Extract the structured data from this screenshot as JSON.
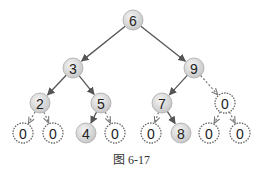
{
  "caption": "图 6-17",
  "colors": {
    "node_fill": "#d9d9d9",
    "node_stroke": "#aaaaaa",
    "edge": "#555555",
    "dashed_edge": "#777777",
    "null_fill": "#ffffff"
  },
  "nodes": [
    {
      "id": "n6",
      "label": "6",
      "x": 133,
      "y": 20,
      "null": false
    },
    {
      "id": "n3",
      "label": "3",
      "x": 73,
      "y": 68,
      "null": false
    },
    {
      "id": "n9",
      "label": "9",
      "x": 194,
      "y": 68,
      "null": false
    },
    {
      "id": "n2",
      "label": "2",
      "x": 40,
      "y": 103,
      "null": false
    },
    {
      "id": "n5",
      "label": "5",
      "x": 101,
      "y": 103,
      "null": false
    },
    {
      "id": "n7",
      "label": "7",
      "x": 162,
      "y": 103,
      "null": false
    },
    {
      "id": "n9r",
      "label": "0",
      "x": 225,
      "y": 103,
      "null": true
    },
    {
      "id": "n2l",
      "label": "0",
      "x": 23,
      "y": 133,
      "null": true
    },
    {
      "id": "n2r",
      "label": "0",
      "x": 53,
      "y": 133,
      "null": true
    },
    {
      "id": "n4",
      "label": "4",
      "x": 86,
      "y": 133,
      "null": false
    },
    {
      "id": "n5r",
      "label": "0",
      "x": 115,
      "y": 133,
      "null": true
    },
    {
      "id": "n7l",
      "label": "0",
      "x": 151,
      "y": 133,
      "null": true
    },
    {
      "id": "n8",
      "label": "8",
      "x": 181,
      "y": 133,
      "null": false
    },
    {
      "id": "n0l",
      "label": "0",
      "x": 209,
      "y": 133,
      "null": true
    },
    {
      "id": "n0r",
      "label": "0",
      "x": 240,
      "y": 133,
      "null": true
    }
  ],
  "edges": [
    {
      "from": "n6",
      "to": "n3",
      "dashed": false
    },
    {
      "from": "n6",
      "to": "n9",
      "dashed": false
    },
    {
      "from": "n3",
      "to": "n2",
      "dashed": false
    },
    {
      "from": "n3",
      "to": "n5",
      "dashed": false
    },
    {
      "from": "n9",
      "to": "n7",
      "dashed": false
    },
    {
      "from": "n9",
      "to": "n9r",
      "dashed": true
    },
    {
      "from": "n2",
      "to": "n2l",
      "dashed": true
    },
    {
      "from": "n2",
      "to": "n2r",
      "dashed": true
    },
    {
      "from": "n5",
      "to": "n4",
      "dashed": false
    },
    {
      "from": "n5",
      "to": "n5r",
      "dashed": true
    },
    {
      "from": "n7",
      "to": "n7l",
      "dashed": true
    },
    {
      "from": "n7",
      "to": "n8",
      "dashed": false
    },
    {
      "from": "n9r",
      "to": "n0l",
      "dashed": true
    },
    {
      "from": "n9r",
      "to": "n0r",
      "dashed": true
    }
  ]
}
